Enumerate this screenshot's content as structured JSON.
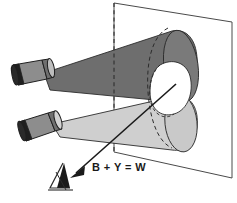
{
  "figure": {
    "background_color": "#ffffff",
    "annotation_label": "B + Y = W",
    "outline_color": "#3b3b3b",
    "ink_color": "#1a1a1a"
  },
  "screen": {
    "name": "projection-screen",
    "fill": "#ffffff",
    "stroke": "#4a4a4a",
    "hidden_edge_style": "dashed",
    "corners": [
      {
        "x": 114,
        "y": 3
      },
      {
        "x": 232,
        "y": 22
      },
      {
        "x": 232,
        "y": 178
      },
      {
        "x": 114,
        "y": 152
      }
    ]
  },
  "projectors": [
    {
      "name": "upper-projector",
      "emits": "blue beam",
      "beam_fill": "#6e6e6e",
      "body_fill": "#8d8d8d",
      "lens_fill": "#1f1f1f",
      "position": {
        "x": 10,
        "y": 62
      }
    },
    {
      "name": "lower-projector",
      "emits": "yellow beam",
      "beam_fill": "#cfcfcf",
      "body_fill": "#8d8d8d",
      "lens_fill": "#1f1f1f",
      "position": {
        "x": 16,
        "y": 118
      }
    }
  ],
  "beams": [
    {
      "name": "blue-beam-cone",
      "letter": "B",
      "fill": "#6e6e6e",
      "stroke": "#2b2b2b",
      "description": "dark cone from upper projector to screen"
    },
    {
      "name": "yellow-beam-cone",
      "letter": "Y",
      "fill": "#cfcfcf",
      "stroke": "#2b2b2b",
      "description": "light cone from lower projector to screen"
    }
  ],
  "overlap": {
    "name": "white-overlap-patch",
    "letter": "W",
    "fill": "#ffffff",
    "stroke": "#2b2b2b",
    "description": "region on screen where both beams overlap, appears white"
  },
  "sight_arrow": {
    "name": "line-of-sight-arrow",
    "from": {
      "x": 176,
      "y": 84
    },
    "to": {
      "x": 72,
      "y": 176
    },
    "stroke": "#1a1a1a",
    "head": "filled-triangle"
  },
  "observer": {
    "name": "observer-eye-symbol",
    "fill": "#1a1a1a",
    "position": {
      "x": 52,
      "y": 168
    }
  }
}
